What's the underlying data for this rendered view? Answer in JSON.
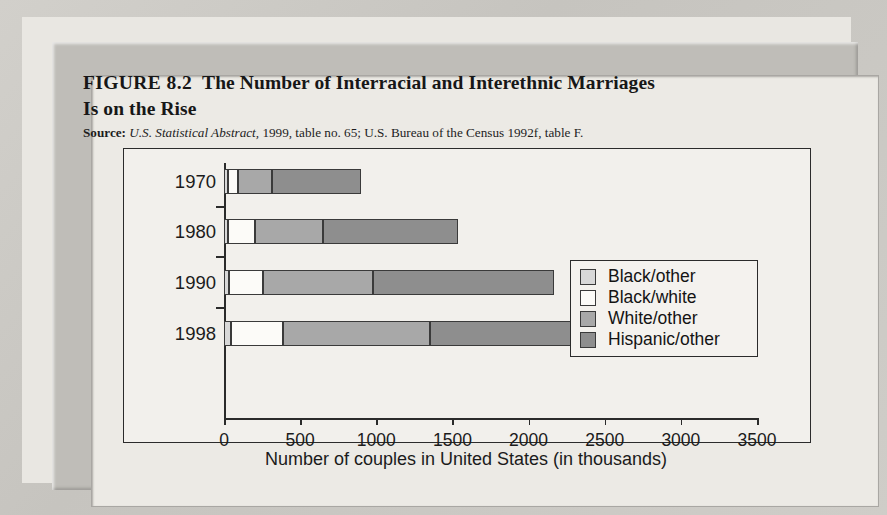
{
  "figure": {
    "label": "FIGURE 8.2",
    "title_line1": "The Number of Interracial and Interethnic Marriages",
    "title_line2": "Is on the Rise",
    "source_label": "Source:",
    "source_italic": "U.S. Statistical Abstract,",
    "source_rest": " 1999, table no. 65; U.S. Bureau of the Census 1992f, table F."
  },
  "axis": {
    "x_title": "Number of couples in United States (in thousands)",
    "x_ticks": [
      "0",
      "500",
      "1000",
      "1500",
      "2000",
      "2500",
      "3000",
      "3500"
    ],
    "y_ticks": [
      "1970",
      "1980",
      "1990",
      "1998"
    ]
  },
  "legend": {
    "items": [
      {
        "label": "Black/other",
        "color": "#d8d8d8"
      },
      {
        "label": "Black/white",
        "color": "#fcfbf8"
      },
      {
        "label": "White/other",
        "color": "#a8a8a8"
      },
      {
        "label": "Hispanic/other",
        "color": "#8e8e8e"
      }
    ]
  },
  "chart_data": {
    "type": "bar",
    "orientation": "horizontal",
    "stacked": true,
    "xlabel": "Number of couples in United States (in thousands)",
    "ylabel": "",
    "xlim": [
      0,
      3500
    ],
    "xticks": [
      0,
      500,
      1000,
      1500,
      2000,
      2500,
      3000,
      3500
    ],
    "grid": false,
    "legend_position": "inside-top-right",
    "categories": [
      "1970",
      "1980",
      "1990",
      "1998"
    ],
    "series": [
      {
        "name": "Black/other",
        "color": "#d8d8d8",
        "values": [
          25,
          25,
          30,
          45
        ]
      },
      {
        "name": "Black/white",
        "color": "#fcfbf8",
        "values": [
          65,
          180,
          225,
          345
        ]
      },
      {
        "name": "White/other",
        "color": "#a8a8a8",
        "values": [
          225,
          445,
          725,
          965
        ]
      },
      {
        "name": "Hispanic/other",
        "color": "#8e8e8e",
        "values": [
          585,
          885,
          1190,
          1670
        ]
      }
    ],
    "totals": [
      900,
      1535,
      2170,
      3025
    ],
    "units": "thousands of couples"
  }
}
